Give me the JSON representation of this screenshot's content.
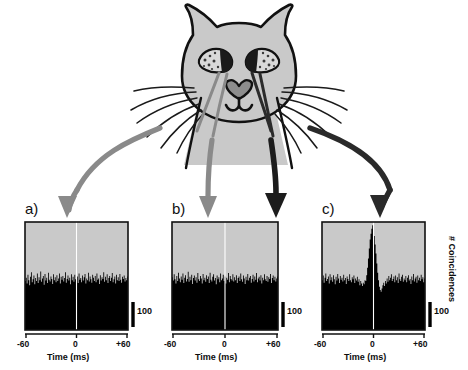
{
  "figure": {
    "background_color": "#ffffff",
    "caption_letters": [
      "a)",
      "b)",
      "c)"
    ]
  },
  "cat": {
    "name": "cat-head-diagram",
    "fill_color": "#c9c9c9",
    "outline_color": "#111111",
    "whisker_color": "#1a1a1a",
    "eye_iris_color": "#d9d9d9",
    "eye_pupil_color": "#1a1a1a",
    "description": "schematic frontal view of a cat head with ears, eyes, heart-shaped nose, mouth and whiskers"
  },
  "arrows": [
    {
      "name": "arrow-to-panel-a",
      "color": "#8a8a8a",
      "label": "left whisker to panel a",
      "target_panel": "a)"
    },
    {
      "name": "arrow-to-panel-b-gray",
      "color": "#8a8a8a",
      "label": "left whisker to panel b",
      "target_panel": "b)"
    },
    {
      "name": "arrow-to-panel-b-black",
      "color": "#1c1c1c",
      "label": "right whisker to panel b",
      "target_panel": "b)"
    },
    {
      "name": "arrow-to-panel-c",
      "color": "#2a2a2a",
      "label": "right whisker to panel c",
      "target_panel": "c)"
    }
  ],
  "panels": [
    {
      "id": "a",
      "letter": "a)",
      "xlabel": "Time (ms)",
      "xticks": [
        "-60",
        "0",
        "+60"
      ],
      "scale_bar_label": "100",
      "plot_bg": "#c9c9c9",
      "hist_color": "#000000",
      "zero_line_color": "#ffffff",
      "ylabel": ""
    },
    {
      "id": "b",
      "letter": "b)",
      "xlabel": "Time (ms)",
      "xticks": [
        "-60",
        "0",
        "+60"
      ],
      "scale_bar_label": "100",
      "plot_bg": "#c9c9c9",
      "hist_color": "#000000",
      "zero_line_color": "#ffffff",
      "ylabel": ""
    },
    {
      "id": "c",
      "letter": "c)",
      "xlabel": "Time (ms)",
      "xticks": [
        "-60",
        "0",
        "+60"
      ],
      "scale_bar_label": "100",
      "plot_bg": "#c9c9c9",
      "hist_color": "#000000",
      "zero_line_color": "#ffffff",
      "ylabel": "# Coincidences"
    }
  ],
  "chart_data": [
    {
      "type": "bar",
      "id": "a",
      "title": "a)",
      "xlabel": "Time (ms)",
      "ylabel": "# Coincidences",
      "xlim": [
        -60,
        60
      ],
      "ylim": [
        0,
        260
      ],
      "xticks": [
        -60,
        0,
        60
      ],
      "xticklabels": [
        "-60",
        "0",
        "+60"
      ],
      "scale_bar": 100,
      "grid": false,
      "legend": false,
      "note": "cross-correlogram, flat: no central peak",
      "x": [
        -60,
        -59,
        -58,
        -57,
        -56,
        -55,
        -54,
        -53,
        -52,
        -51,
        -50,
        -49,
        -48,
        -47,
        -46,
        -45,
        -44,
        -43,
        -42,
        -41,
        -40,
        -39,
        -38,
        -37,
        -36,
        -35,
        -34,
        -33,
        -32,
        -31,
        -30,
        -29,
        -28,
        -27,
        -26,
        -25,
        -24,
        -23,
        -22,
        -21,
        -20,
        -19,
        -18,
        -17,
        -16,
        -15,
        -14,
        -13,
        -12,
        -11,
        -10,
        -9,
        -8,
        -7,
        -6,
        -5,
        -4,
        -3,
        -2,
        -1,
        0,
        1,
        2,
        3,
        4,
        5,
        6,
        7,
        8,
        9,
        10,
        11,
        12,
        13,
        14,
        15,
        16,
        17,
        18,
        19,
        20,
        21,
        22,
        23,
        24,
        25,
        26,
        27,
        28,
        29,
        30,
        31,
        32,
        33,
        34,
        35,
        36,
        37,
        38,
        39,
        40,
        41,
        42,
        43,
        44,
        45,
        46,
        47,
        48,
        49,
        50,
        51,
        52,
        53,
        54,
        55,
        56,
        57,
        58,
        59,
        60
      ],
      "values": [
        118,
        126,
        112,
        133,
        120,
        108,
        128,
        139,
        115,
        122,
        131,
        110,
        125,
        118,
        136,
        113,
        127,
        120,
        141,
        116,
        124,
        130,
        109,
        135,
        119,
        126,
        113,
        138,
        121,
        117,
        129,
        123,
        111,
        134,
        120,
        127,
        115,
        132,
        118,
        124,
        136,
        112,
        128,
        121,
        130,
        117,
        125,
        139,
        114,
        123,
        131,
        119,
        126,
        110,
        134,
        120,
        128,
        116,
        133,
        122,
        118,
        129,
        113,
        136,
        121,
        125,
        115,
        131,
        119,
        127,
        135,
        112,
        124,
        120,
        138,
        117,
        129,
        122,
        114,
        133,
        126,
        118,
        130,
        115,
        136,
        121,
        124,
        111,
        132,
        119,
        127,
        123,
        139,
        116,
        128,
        120,
        134,
        113,
        125,
        130,
        118,
        126,
        137,
        115,
        122,
        129,
        112,
        133,
        120,
        127,
        118,
        135,
        121,
        114,
        128,
        123,
        131,
        117,
        125,
        120,
        129
      ]
    },
    {
      "type": "bar",
      "id": "b",
      "title": "b)",
      "xlabel": "Time (ms)",
      "ylabel": "# Coincidences",
      "xlim": [
        -60,
        60
      ],
      "ylim": [
        0,
        260
      ],
      "xticks": [
        -60,
        0,
        60
      ],
      "xticklabels": [
        "-60",
        "0",
        "+60"
      ],
      "scale_bar": 100,
      "grid": false,
      "legend": false,
      "note": "cross-correlogram, flat: no central peak",
      "x": [
        -60,
        -59,
        -58,
        -57,
        -56,
        -55,
        -54,
        -53,
        -52,
        -51,
        -50,
        -49,
        -48,
        -47,
        -46,
        -45,
        -44,
        -43,
        -42,
        -41,
        -40,
        -39,
        -38,
        -37,
        -36,
        -35,
        -34,
        -33,
        -32,
        -31,
        -30,
        -29,
        -28,
        -27,
        -26,
        -25,
        -24,
        -23,
        -22,
        -21,
        -20,
        -19,
        -18,
        -17,
        -16,
        -15,
        -14,
        -13,
        -12,
        -11,
        -10,
        -9,
        -8,
        -7,
        -6,
        -5,
        -4,
        -3,
        -2,
        -1,
        0,
        1,
        2,
        3,
        4,
        5,
        6,
        7,
        8,
        9,
        10,
        11,
        12,
        13,
        14,
        15,
        16,
        17,
        18,
        19,
        20,
        21,
        22,
        23,
        24,
        25,
        26,
        27,
        28,
        29,
        30,
        31,
        32,
        33,
        34,
        35,
        36,
        37,
        38,
        39,
        40,
        41,
        42,
        43,
        44,
        45,
        46,
        47,
        48,
        49,
        50,
        51,
        52,
        53,
        54,
        55,
        56,
        57,
        58,
        59,
        60
      ],
      "values": [
        127,
        119,
        134,
        122,
        112,
        130,
        118,
        138,
        124,
        115,
        129,
        121,
        136,
        113,
        126,
        132,
        117,
        123,
        140,
        116,
        128,
        120,
        133,
        111,
        125,
        131,
        119,
        127,
        114,
        137,
        122,
        118,
        130,
        124,
        112,
        135,
        120,
        126,
        116,
        132,
        123,
        129,
        113,
        138,
        121,
        117,
        128,
        134,
        119,
        125,
        110,
        131,
        122,
        127,
        115,
        136,
        120,
        124,
        133,
        118,
        129,
        112,
        126,
        121,
        137,
        115,
        130,
        123,
        119,
        134,
        117,
        127,
        120,
        132,
        113,
        125,
        129,
        118,
        136,
        122,
        116,
        131,
        124,
        111,
        128,
        120,
        135,
        119,
        126,
        130,
        114,
        123,
        133,
        117,
        129,
        121,
        137,
        115,
        124,
        128,
        119,
        132,
        112,
        126,
        120,
        134,
        122,
        118,
        130,
        116,
        127,
        123,
        135,
        113,
        125,
        131,
        120,
        128,
        117,
        124,
        129
      ]
    },
    {
      "type": "bar",
      "id": "c",
      "title": "c)",
      "xlabel": "Time (ms)",
      "ylabel": "# Coincidences",
      "xlim": [
        -60,
        60
      ],
      "ylim": [
        0,
        260
      ],
      "xticks": [
        -60,
        0,
        60
      ],
      "xticklabels": [
        "-60",
        "0",
        "+60"
      ],
      "scale_bar": 100,
      "grid": false,
      "legend": false,
      "note": "cross-correlogram with sharp central peak at 0 ms and flanking troughs",
      "x": [
        -60,
        -59,
        -58,
        -57,
        -56,
        -55,
        -54,
        -53,
        -52,
        -51,
        -50,
        -49,
        -48,
        -47,
        -46,
        -45,
        -44,
        -43,
        -42,
        -41,
        -40,
        -39,
        -38,
        -37,
        -36,
        -35,
        -34,
        -33,
        -32,
        -31,
        -30,
        -29,
        -28,
        -27,
        -26,
        -25,
        -24,
        -23,
        -22,
        -21,
        -20,
        -19,
        -18,
        -17,
        -16,
        -15,
        -14,
        -13,
        -12,
        -11,
        -10,
        -9,
        -8,
        -7,
        -6,
        -5,
        -4,
        -3,
        -2,
        -1,
        0,
        1,
        2,
        3,
        4,
        5,
        6,
        7,
        8,
        9,
        10,
        11,
        12,
        13,
        14,
        15,
        16,
        17,
        18,
        19,
        20,
        21,
        22,
        23,
        24,
        25,
        26,
        27,
        28,
        29,
        30,
        31,
        32,
        33,
        34,
        35,
        36,
        37,
        38,
        39,
        40,
        41,
        42,
        43,
        44,
        45,
        46,
        47,
        48,
        49,
        50,
        51,
        52,
        53,
        54,
        55,
        56,
        57,
        58,
        59,
        60
      ],
      "values": [
        120,
        131,
        114,
        126,
        136,
        118,
        123,
        129,
        112,
        134,
        120,
        127,
        116,
        132,
        122,
        110,
        128,
        119,
        135,
        124,
        113,
        130,
        121,
        126,
        117,
        133,
        120,
        125,
        111,
        129,
        123,
        118,
        134,
        120,
        115,
        127,
        122,
        131,
        113,
        124,
        119,
        128,
        116,
        122,
        108,
        118,
        112,
        106,
        114,
        110,
        120,
        118,
        132,
        150,
        172,
        196,
        218,
        232,
        244,
        252,
        238,
        226,
        206,
        184,
        160,
        138,
        120,
        104,
        96,
        92,
        100,
        108,
        114,
        106,
        118,
        112,
        124,
        116,
        130,
        120,
        126,
        134,
        118,
        123,
        129,
        115,
        131,
        120,
        127,
        113,
        136,
        122,
        118,
        128,
        133,
        116,
        124,
        120,
        130,
        115,
        126,
        132,
        119,
        123,
        111,
        129,
        120,
        135,
        117,
        124,
        128,
        114,
        131,
        120,
        126,
        118,
        133,
        122,
        127,
        115,
        124
      ]
    }
  ]
}
